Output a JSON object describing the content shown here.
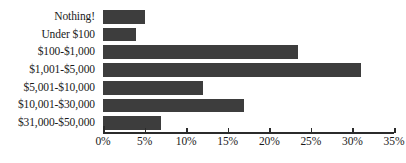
{
  "chart_data": {
    "type": "bar",
    "orientation": "horizontal",
    "title": "",
    "subtitle": "",
    "xlabel": "",
    "ylabel": "",
    "categories": [
      "Nothing!",
      "Under $100",
      "$100-$1,000",
      "$1,001-$5,000",
      "$5,001-$10,000",
      "$10,001-$30,000",
      "$31,000-$50,000"
    ],
    "values": [
      5,
      4,
      23.5,
      31,
      12,
      17,
      7
    ],
    "xlim": [
      0,
      35
    ],
    "xtick_values": [
      0,
      5,
      10,
      15,
      20,
      25,
      30,
      35
    ],
    "xtick_labels": [
      "0%",
      "5%",
      "10%",
      "15%",
      "20%",
      "25%",
      "30%",
      "35%"
    ],
    "grid": false,
    "legend": null,
    "legend_position": "none",
    "bar_color": "#3d3d3d",
    "axis_color": "#2b2b2b",
    "text_color": "#1a1a1a",
    "background_color": "#ffffff",
    "value_labels_shown": false
  }
}
